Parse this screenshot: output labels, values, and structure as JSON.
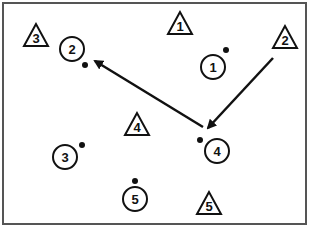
{
  "diagram": {
    "frame": {
      "x": 3,
      "y": 3,
      "w": 303,
      "h": 221,
      "stroke": "#555555"
    },
    "triangles": [
      {
        "label": "1",
        "cx": 180,
        "cy": 24
      },
      {
        "label": "2",
        "cx": 285,
        "cy": 38
      },
      {
        "label": "3",
        "cx": 36,
        "cy": 36
      },
      {
        "label": "4",
        "cx": 137,
        "cy": 125
      },
      {
        "label": "5",
        "cx": 209,
        "cy": 204
      }
    ],
    "circles": [
      {
        "label": "1",
        "cx": 213,
        "cy": 67,
        "dot": {
          "x": 226,
          "y": 50
        }
      },
      {
        "label": "2",
        "cx": 72,
        "cy": 49,
        "dot": {
          "x": 85,
          "y": 65
        }
      },
      {
        "label": "3",
        "cx": 65,
        "cy": 157,
        "dot": {
          "x": 82,
          "y": 145
        }
      },
      {
        "label": "4",
        "cx": 217,
        "cy": 151,
        "dot": {
          "x": 200,
          "y": 140
        }
      },
      {
        "label": "5",
        "cx": 135,
        "cy": 199,
        "dot": {
          "x": 135,
          "y": 181
        }
      }
    ],
    "arrows": [
      {
        "from": {
          "x": 273,
          "y": 58
        },
        "to": {
          "x": 208,
          "y": 128
        }
      },
      {
        "from": {
          "x": 203,
          "y": 127
        },
        "to": {
          "x": 95,
          "y": 61
        }
      }
    ]
  }
}
